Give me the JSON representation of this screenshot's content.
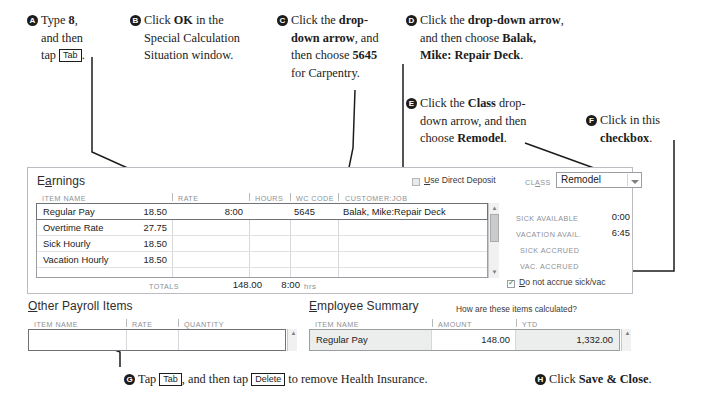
{
  "callouts": [
    {
      "id": "A",
      "badge": "A",
      "lines": [
        "Type <b>8</b>,",
        "and then",
        "tap <key>Tab</key>."
      ]
    },
    {
      "id": "B",
      "badge": "B",
      "lines": [
        "Click <b>OK</b> in the",
        "Special Calculation",
        "Situation window."
      ]
    },
    {
      "id": "C",
      "badge": "C",
      "lines": [
        "Click the <b>drop-</b>",
        "<b>down arrow</b>, and",
        "then choose <b>5645</b>",
        "for Carpentry."
      ]
    },
    {
      "id": "D",
      "badge": "D",
      "lines": [
        "Click the <b>drop-down arrow</b>,",
        "and then choose <b>Balak,</b>",
        "<b>Mike: Repair Deck</b>."
      ]
    },
    {
      "id": "E",
      "badge": "E",
      "lines": [
        "Click the <b>Class</b> drop-",
        "down arrow, and then",
        "choose <b>Remodel</b>."
      ]
    },
    {
      "id": "F",
      "badge": "F",
      "lines": [
        "Click in this",
        "<b>checkbox</b>."
      ]
    },
    {
      "id": "G",
      "badge": "G",
      "lines": [
        "Tap <key>Tab</key>, and then tap <key>Delete</key> to remove Health Insurance."
      ]
    },
    {
      "id": "H",
      "badge": "H",
      "lines": [
        "Click <b>Save &amp; Close</b>."
      ]
    }
  ],
  "earnings": {
    "title_pre": "E",
    "title_underline": "a",
    "title_post": "rnings",
    "columns": [
      "ITEM NAME",
      "RATE",
      "HOURS",
      "WC CODE",
      "CUSTOMER:JOB"
    ],
    "rows": [
      {
        "item": "Regular Pay",
        "rate": "18.50",
        "hours": "8:00",
        "wc": "5645",
        "job": "Balak, Mike:Repair Deck",
        "selected": true
      },
      {
        "item": "Overtime Rate",
        "rate": "27.75",
        "hours": "",
        "wc": "",
        "job": "",
        "selected": false
      },
      {
        "item": "Sick Hourly",
        "rate": "18.50",
        "hours": "",
        "wc": "",
        "job": "",
        "selected": false
      },
      {
        "item": "Vacation Hourly",
        "rate": "18.50",
        "hours": "",
        "wc": "",
        "job": "",
        "selected": false
      }
    ],
    "totals_label": "TOTALS",
    "totals_amount": "148.00",
    "totals_hours": "8:00",
    "totals_hours_unit": "hrs"
  },
  "deposit": {
    "checkbox_label_pre": "U",
    "checkbox_label_underline": "U",
    "checkbox_label": "Use Direct Deposit",
    "checked": false
  },
  "class_field": {
    "label_pre": "CL",
    "label_underline": "A",
    "label_post": "SS",
    "label": "CLASS",
    "value": "Remodel",
    "arrow_icon": "chevron-down-icon"
  },
  "accruals": [
    {
      "label": "SICK AVAILABLE",
      "value": "0:00"
    },
    {
      "label": "VACATION AVAIL.",
      "value": "6:45"
    },
    {
      "label": "SICK ACCRUED",
      "value": ""
    },
    {
      "label": "VAC. ACCRUED",
      "value": ""
    }
  ],
  "accrue_checkbox": {
    "label": "Do not accrue sick/vac",
    "label_underline": "D",
    "checked": true
  },
  "other_payroll": {
    "title_pre": "O",
    "title_underline": "O",
    "title_post": "ther Payroll Items",
    "title": "Other Payroll Items",
    "columns": [
      "ITEM NAME",
      "RATE",
      "QUANTITY"
    ],
    "rows": [
      {
        "item": "",
        "rate": "",
        "quantity": "",
        "selected": true
      }
    ]
  },
  "employee_summary": {
    "title": "Employee Summary",
    "title_underline": "E",
    "help_link": "How are these items calculated?",
    "columns": [
      "ITEM NAME",
      "AMOUNT",
      "YTD"
    ],
    "rows": [
      {
        "item": "Regular Pay",
        "amount": "148.00",
        "ytd": "1,332.00"
      }
    ]
  },
  "colors": {
    "panel_border": "#b9bcc0",
    "grid_border": "#9a9da1",
    "header_text": "#8d9196",
    "text": "#222222",
    "scroll_track": "#f1f1f1",
    "scroll_thumb": "#c9cbcd",
    "selected_row_border": "#6f7276",
    "summary_row_bg": "#eceded"
  }
}
